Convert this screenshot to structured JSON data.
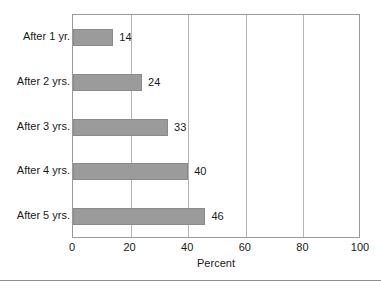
{
  "chart_data": {
    "type": "bar",
    "orientation": "horizontal",
    "title": "",
    "subtitle": "",
    "xlabel": "Percent",
    "ylabel": "",
    "categories": [
      "After 1 yr.",
      "After 2 yrs.",
      "After 3 yrs.",
      "After 4 yrs.",
      "After 5 yrs."
    ],
    "values": [
      14,
      24,
      33,
      40,
      46
    ],
    "data_labels": [
      "14",
      "24",
      "33",
      "40",
      "46"
    ],
    "xlim": [
      0,
      100
    ],
    "xticks": [
      0,
      20,
      40,
      60,
      80,
      100
    ],
    "xtick_labels": [
      "0",
      "20",
      "40",
      "60",
      "80",
      "100"
    ],
    "grid": "vertical",
    "legend": "none",
    "series": [
      {
        "name": "Percent",
        "values": [
          14,
          24,
          33,
          40,
          46
        ]
      }
    ]
  },
  "style": {
    "bar_fill": "#9b9b9b",
    "bar_stroke": "#8a8a8a",
    "grid_color": "#b5b5b5",
    "frame_color": "#9a9a9a",
    "text_color": "#1a1a1a",
    "background": "#ffffff",
    "rule_color": "#8f8f8f"
  }
}
